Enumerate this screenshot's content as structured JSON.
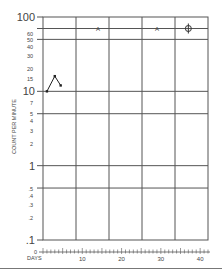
{
  "chart_data": {
    "type": "line",
    "title": "",
    "xlabel": "DAYS",
    "ylabel": "COUNT PER MINUTE",
    "yscale": "log",
    "ylim": [
      0.1,
      100
    ],
    "xlim": [
      0,
      42
    ],
    "grid": true,
    "legend": null,
    "y_major_ticks": [
      {
        "value": 100,
        "label": "100"
      },
      {
        "value": 10,
        "label": "10"
      },
      {
        "value": 1,
        "label": "1"
      },
      {
        "value": 0.1,
        "label": ".1"
      }
    ],
    "y_minor_ticks": [
      {
        "value": 60,
        "label": "60"
      },
      {
        "value": 50,
        "label": "50"
      },
      {
        "value": 40,
        "label": "40"
      },
      {
        "value": 30,
        "label": "30"
      },
      {
        "value": 20,
        "label": "20"
      },
      {
        "value": 15,
        "label": "15"
      },
      {
        "value": 7,
        "label": "7"
      },
      {
        "value": 5,
        "label": "5"
      },
      {
        "value": 4,
        "label": "4"
      },
      {
        "value": 3,
        "label": "3"
      },
      {
        "value": 2,
        "label": "2"
      },
      {
        "value": 0.5,
        "label": ".5"
      },
      {
        "value": 0.4,
        "label": ".4"
      },
      {
        "value": 0.3,
        "label": ".3"
      },
      {
        "value": 0.2,
        "label": ".2"
      }
    ],
    "x_ticks": [
      {
        "value": 0,
        "label": "0"
      },
      {
        "value": 10,
        "label": "10"
      },
      {
        "value": 20,
        "label": "20"
      },
      {
        "value": 30,
        "label": "30"
      },
      {
        "value": 40,
        "label": "40"
      }
    ],
    "series": [
      {
        "name": "count",
        "x": [
          1,
          3,
          4.5
        ],
        "values": [
          10,
          16,
          12
        ]
      }
    ],
    "annotations": [
      {
        "x": 14,
        "y": 70,
        "marker": "A",
        "label": "A"
      },
      {
        "x": 29,
        "y": 70,
        "marker": "A",
        "label": "A"
      },
      {
        "x": 37,
        "y": 70,
        "marker": "crossed-circle",
        "label": ""
      }
    ]
  }
}
